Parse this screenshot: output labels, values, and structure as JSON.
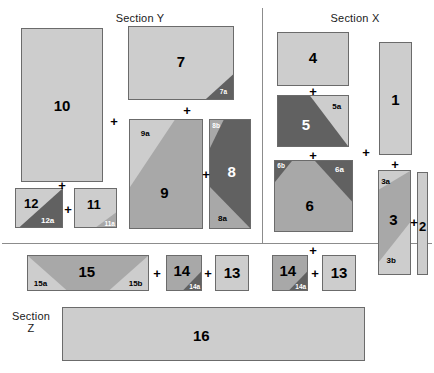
{
  "sections": [
    {
      "id": "y",
      "label": "Section Y",
      "x": 140,
      "y": 12
    },
    {
      "id": "x",
      "label": "Section X",
      "x": 355,
      "y": 12
    },
    {
      "id": "z",
      "label": "Section\nZ",
      "x": 31,
      "y": 310
    }
  ],
  "dividers": [
    {
      "id": "vertical-top",
      "x": 262,
      "y": 8,
      "w": 1,
      "h": 235
    },
    {
      "id": "horizontal-mid",
      "x": 2,
      "y": 243,
      "w": 430,
      "h": 1
    }
  ],
  "palette": {
    "light": "#cdcdcd",
    "medium": "#a8a8a8",
    "dark": "#616161",
    "stroke": "#6b6b6b",
    "text": "#000000",
    "text_light": "#ffffff",
    "divider": "#8c8c8c",
    "background": "#ffffff"
  },
  "blocks": [
    {
      "id": "b10",
      "label": "10",
      "x": 21,
      "y": 28,
      "w": 82,
      "h": 154,
      "fill": "light",
      "label_pos": [
        0.5,
        0.5
      ],
      "label_tone": "dark",
      "parts": []
    },
    {
      "id": "b12",
      "label": "12",
      "x": 15,
      "y": 188,
      "w": 48,
      "h": 40,
      "fill": "light",
      "label_pos": [
        0.34,
        0.38
      ],
      "label_tone": "dark",
      "label_size": "sm",
      "parts": [
        {
          "id": "12a",
          "label": "12a",
          "poly": "100,0 100,100 8,100",
          "fill": "dark",
          "tone": "light",
          "pos": [
            0.68,
            0.8
          ]
        }
      ]
    },
    {
      "id": "b11",
      "label": "11",
      "x": 74,
      "y": 188,
      "w": 43,
      "h": 40,
      "fill": "light",
      "label_pos": [
        0.46,
        0.4
      ],
      "label_tone": "dark",
      "label_size": "sm",
      "parts": [
        {
          "id": "11a",
          "label": "11a",
          "poly": "100,62 100,100 52,100",
          "fill": "medium",
          "tone": "light",
          "pos": [
            0.83,
            0.88
          ],
          "size": "tiny"
        }
      ]
    },
    {
      "id": "b7",
      "label": "7",
      "x": 128,
      "y": 26,
      "w": 106,
      "h": 74,
      "fill": "light",
      "label_pos": [
        0.5,
        0.47
      ],
      "label_tone": "dark",
      "parts": [
        {
          "id": "7a",
          "label": "7a",
          "poly": "100,66 100,100 74,100",
          "fill": "dark",
          "tone": "light",
          "pos": [
            0.9,
            0.88
          ],
          "size": "tiny"
        }
      ]
    },
    {
      "id": "b9",
      "label": "9",
      "x": 129,
      "y": 119,
      "w": 74,
      "h": 110,
      "fill": "medium",
      "label_pos": [
        0.48,
        0.66
      ],
      "label_tone": "dark",
      "parts": [
        {
          "id": "9a",
          "label": "9a",
          "poly": "0,0 62,0 0,62",
          "fill": "light",
          "tone": "dark",
          "pos": [
            0.22,
            0.13
          ]
        }
      ]
    },
    {
      "id": "b8",
      "label": "8",
      "x": 209,
      "y": 119,
      "w": 42,
      "h": 110,
      "fill": "dark",
      "label_pos": [
        0.54,
        0.47
      ],
      "label_tone": "light",
      "parts": [
        {
          "id": "8b",
          "label": "8b",
          "poly": "0,0 34,0 0,26",
          "fill": "medium",
          "tone": "light",
          "pos": [
            0.17,
            0.05
          ],
          "size": "tiny"
        },
        {
          "id": "8a",
          "label": "8a",
          "poly": "0,62 100,100 0,100",
          "fill": "medium",
          "tone": "dark",
          "pos": [
            0.32,
            0.9
          ]
        }
      ]
    },
    {
      "id": "b15",
      "label": "15",
      "x": 27,
      "y": 255,
      "w": 122,
      "h": 36,
      "fill": "medium",
      "label_pos": [
        0.49,
        0.44
      ],
      "label_tone": "dark",
      "parts": [
        {
          "id": "15a",
          "label": "15a",
          "poly": "0,0 32,100 0,100",
          "fill": "light",
          "tone": "dark",
          "pos": [
            0.11,
            0.78
          ]
        },
        {
          "id": "15b",
          "label": "15b",
          "poly": "100,0 100,100 68,100",
          "fill": "light",
          "tone": "dark",
          "pos": [
            0.89,
            0.78
          ]
        }
      ]
    },
    {
      "id": "b14l",
      "label": "14",
      "x": 166,
      "y": 255,
      "w": 36,
      "h": 36,
      "fill": "medium",
      "label_pos": [
        0.44,
        0.42
      ],
      "label_tone": "dark",
      "parts": [
        {
          "id": "14a",
          "label": "14a",
          "poly": "100,46 100,100 48,100",
          "fill": "dark",
          "tone": "light",
          "pos": [
            0.8,
            0.86
          ],
          "size": "tiny"
        }
      ]
    },
    {
      "id": "b13l",
      "label": "13",
      "x": 215,
      "y": 255,
      "w": 34,
      "h": 36,
      "fill": "light",
      "label_pos": [
        0.5,
        0.46
      ],
      "label_tone": "dark",
      "parts": []
    },
    {
      "id": "b16",
      "label": "16",
      "x": 62,
      "y": 307,
      "w": 303,
      "h": 54,
      "fill": "light",
      "label_pos": [
        0.46,
        0.52
      ],
      "label_tone": "dark",
      "parts": []
    },
    {
      "id": "b4",
      "label": "4",
      "x": 277,
      "y": 32,
      "w": 72,
      "h": 54,
      "fill": "light",
      "label_pos": [
        0.5,
        0.47
      ],
      "label_tone": "dark",
      "parts": []
    },
    {
      "id": "b5",
      "label": "5",
      "x": 277,
      "y": 95,
      "w": 72,
      "h": 52,
      "fill": "dark",
      "label_pos": [
        0.4,
        0.55
      ],
      "label_tone": "light",
      "parts": [
        {
          "id": "5a",
          "label": "5a",
          "poly": "46,0 100,0 100,100",
          "fill": "light",
          "tone": "dark",
          "pos": [
            0.83,
            0.22
          ]
        }
      ]
    },
    {
      "id": "b6",
      "label": "6",
      "x": 274,
      "y": 160,
      "w": 79,
      "h": 72,
      "fill": "medium",
      "label_pos": [
        0.45,
        0.62
      ],
      "label_tone": "dark",
      "parts": [
        {
          "id": "6b",
          "label": "6b",
          "poly": "0,0 22,0 0,30",
          "fill": "dark",
          "tone": "light",
          "pos": [
            0.09,
            0.07
          ],
          "size": "tiny"
        },
        {
          "id": "6a",
          "label": "6a",
          "poly": "52,0 100,0 100,58",
          "fill": "dark",
          "tone": "light",
          "pos": [
            0.83,
            0.13
          ]
        }
      ]
    },
    {
      "id": "b14r",
      "label": "14",
      "x": 272,
      "y": 255,
      "w": 36,
      "h": 36,
      "fill": "medium",
      "label_pos": [
        0.44,
        0.42
      ],
      "label_tone": "dark",
      "parts": [
        {
          "id": "14a-r",
          "label": "14a",
          "poly": "100,46 100,100 48,100",
          "fill": "dark",
          "tone": "light",
          "pos": [
            0.8,
            0.86
          ],
          "size": "tiny"
        }
      ]
    },
    {
      "id": "b13r",
      "label": "13",
      "x": 322,
      "y": 255,
      "w": 34,
      "h": 36,
      "fill": "light",
      "label_pos": [
        0.5,
        0.46
      ],
      "label_tone": "dark",
      "parts": []
    },
    {
      "id": "b1",
      "label": "1",
      "x": 379,
      "y": 42,
      "w": 33,
      "h": 113,
      "fill": "light",
      "label_pos": [
        0.5,
        0.5
      ],
      "label_tone": "dark",
      "parts": []
    },
    {
      "id": "b3",
      "label": "3",
      "x": 378,
      "y": 170,
      "w": 33,
      "h": 105,
      "fill": "light",
      "label_pos": [
        0.47,
        0.47
      ],
      "label_tone": "dark",
      "parts": [
        {
          "id": "3band",
          "label": "",
          "poly": "0,18 100,0 100,50 0,88",
          "fill": "medium",
          "tone": "dark",
          "pos": [
            0.5,
            0.5
          ]
        },
        {
          "id": "3a",
          "label": "3a",
          "poly": "",
          "fill": "",
          "tone": "dark",
          "pos": [
            0.23,
            0.1
          ],
          "label_only": true
        },
        {
          "id": "3b",
          "label": "3b",
          "poly": "",
          "fill": "",
          "tone": "dark",
          "pos": [
            0.4,
            0.86
          ],
          "label_only": true
        }
      ]
    },
    {
      "id": "b2",
      "label": "2",
      "x": 417,
      "y": 172,
      "w": 11,
      "h": 103,
      "fill": "light",
      "label_pos": [
        0.5,
        0.52
      ],
      "label_tone": "dark",
      "label_size": "sm",
      "parts": []
    }
  ],
  "operators": [
    {
      "id": "op-10-12",
      "symbol": "+",
      "x": 62,
      "y": 185
    },
    {
      "id": "op-12-11",
      "symbol": "+",
      "x": 68,
      "y": 209
    },
    {
      "id": "op-10-col",
      "symbol": "+",
      "x": 114,
      "y": 121
    },
    {
      "id": "op-7-9",
      "symbol": "+",
      "x": 187,
      "y": 110
    },
    {
      "id": "op-9-8",
      "symbol": "+",
      "x": 206,
      "y": 174
    },
    {
      "id": "op-15-14",
      "symbol": "+",
      "x": 157,
      "y": 273
    },
    {
      "id": "op-14-13",
      "symbol": "+",
      "x": 208,
      "y": 273
    },
    {
      "id": "op-4-5",
      "symbol": "+",
      "x": 313,
      "y": 91
    },
    {
      "id": "op-5-6",
      "symbol": "+",
      "x": 313,
      "y": 155
    },
    {
      "id": "op-6-14",
      "symbol": "+",
      "x": 313,
      "y": 250
    },
    {
      "id": "op-14r-13r",
      "symbol": "+",
      "x": 315,
      "y": 273
    },
    {
      "id": "op-1-3",
      "symbol": "+",
      "x": 395,
      "y": 164
    },
    {
      "id": "op-3-2",
      "symbol": "+",
      "x": 414,
      "y": 222
    },
    {
      "id": "op-x-col",
      "symbol": "+",
      "x": 366,
      "y": 152
    }
  ]
}
